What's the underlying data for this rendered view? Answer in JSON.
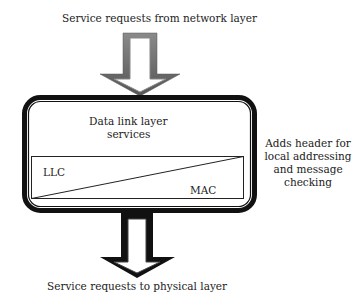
{
  "diagram": {
    "top_label": "Service requests from network layer",
    "bottom_label": "Service requests to physical layer",
    "box": {
      "title_line1": "Data link layer",
      "title_line2": "services",
      "sublayer_left": "LLC",
      "sublayer_right": "MAC"
    },
    "annotation": {
      "line1": "Adds header for",
      "line2": "local addressing",
      "line3": "and message",
      "line4": "checking"
    },
    "colors": {
      "top_arrow": "#6e6e6e",
      "bottom_arrow": "#111111",
      "box_border": "#111111"
    }
  }
}
